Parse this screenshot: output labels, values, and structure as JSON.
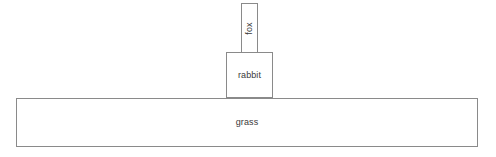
{
  "diagram": {
    "background_color": "#ffffff",
    "line_color": "#8a8a8a",
    "text_color": "#3a3a3a",
    "levels": [
      {
        "id": "fox",
        "label": "fox",
        "trophic_level": 3,
        "role": "secondary consumer",
        "orientation": "vertical",
        "x": 241,
        "y": 3,
        "width": 17,
        "height": 50
      },
      {
        "id": "rabbit",
        "label": "rabbit",
        "trophic_level": 2,
        "role": "primary consumer",
        "orientation": "horizontal",
        "x": 226,
        "y": 52,
        "width": 47,
        "height": 46
      },
      {
        "id": "grass",
        "label": "grass",
        "trophic_level": 1,
        "role": "producer",
        "orientation": "horizontal",
        "x": 16,
        "y": 98,
        "width": 462,
        "height": 49
      }
    ]
  },
  "chart_data": {
    "type": "bar",
    "title": "",
    "xlabel": "",
    "ylabel": "",
    "categories": [
      "grass",
      "rabbit",
      "fox"
    ],
    "values": [
      462,
      47,
      17
    ],
    "value_unit": "relative width (px)",
    "orientation": "pyramid",
    "legend": "none",
    "grid": false
  }
}
